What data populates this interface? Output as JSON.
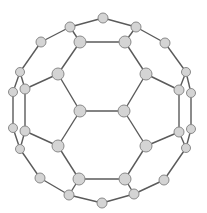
{
  "diagram": {
    "title": "",
    "colors": {
      "background": "#ffffff",
      "edge": "#5a5a5a",
      "node_fill": "#d4d4d4",
      "node_stroke": "#8a8a8a"
    },
    "nodes": [
      {
        "id": 0,
        "x": 103,
        "y": 18,
        "r": 5
      },
      {
        "id": 1,
        "x": 70,
        "y": 27,
        "r": 5
      },
      {
        "id": 2,
        "x": 136,
        "y": 27,
        "r": 5
      },
      {
        "id": 3,
        "x": 80,
        "y": 42,
        "r": 6
      },
      {
        "id": 4,
        "x": 125,
        "y": 42,
        "r": 6
      },
      {
        "id": 5,
        "x": 41,
        "y": 42,
        "r": 5
      },
      {
        "id": 6,
        "x": 165,
        "y": 43,
        "r": 5
      },
      {
        "id": 7,
        "x": 20,
        "y": 72,
        "r": 4.5
      },
      {
        "id": 8,
        "x": 186,
        "y": 72,
        "r": 4.5
      },
      {
        "id": 9,
        "x": 58,
        "y": 74,
        "r": 6
      },
      {
        "id": 10,
        "x": 146,
        "y": 74,
        "r": 6
      },
      {
        "id": 11,
        "x": 13,
        "y": 92,
        "r": 4.5
      },
      {
        "id": 12,
        "x": 25,
        "y": 89,
        "r": 5
      },
      {
        "id": 13,
        "x": 179,
        "y": 90,
        "r": 5
      },
      {
        "id": 14,
        "x": 191,
        "y": 93,
        "r": 4.5
      },
      {
        "id": 15,
        "x": 80,
        "y": 111,
        "r": 6
      },
      {
        "id": 16,
        "x": 124,
        "y": 111,
        "r": 6
      },
      {
        "id": 17,
        "x": 13,
        "y": 128,
        "r": 4.5
      },
      {
        "id": 18,
        "x": 25,
        "y": 131,
        "r": 5
      },
      {
        "id": 19,
        "x": 179,
        "y": 132,
        "r": 5
      },
      {
        "id": 20,
        "x": 191,
        "y": 129,
        "r": 4.5
      },
      {
        "id": 21,
        "x": 20,
        "y": 149,
        "r": 4.5
      },
      {
        "id": 22,
        "x": 186,
        "y": 148,
        "r": 4.5
      },
      {
        "id": 23,
        "x": 58,
        "y": 146,
        "r": 6
      },
      {
        "id": 24,
        "x": 146,
        "y": 146,
        "r": 6
      },
      {
        "id": 25,
        "x": 40,
        "y": 178,
        "r": 5
      },
      {
        "id": 26,
        "x": 164,
        "y": 180,
        "r": 5
      },
      {
        "id": 27,
        "x": 79,
        "y": 179,
        "r": 6
      },
      {
        "id": 28,
        "x": 125,
        "y": 179,
        "r": 6
      },
      {
        "id": 29,
        "x": 69,
        "y": 195,
        "r": 5
      },
      {
        "id": 30,
        "x": 134,
        "y": 194,
        "r": 5
      },
      {
        "id": 31,
        "x": 102,
        "y": 203,
        "r": 5
      }
    ],
    "edges": [
      [
        0,
        1
      ],
      [
        0,
        2
      ],
      [
        1,
        3
      ],
      [
        2,
        4
      ],
      [
        3,
        4
      ],
      [
        1,
        5
      ],
      [
        2,
        6
      ],
      [
        5,
        7
      ],
      [
        6,
        8
      ],
      [
        3,
        9
      ],
      [
        4,
        10
      ],
      [
        7,
        11
      ],
      [
        7,
        12
      ],
      [
        8,
        13
      ],
      [
        8,
        14
      ],
      [
        9,
        12
      ],
      [
        10,
        13
      ],
      [
        9,
        15
      ],
      [
        10,
        16
      ],
      [
        15,
        16
      ],
      [
        11,
        17
      ],
      [
        12,
        18
      ],
      [
        13,
        19
      ],
      [
        14,
        20
      ],
      [
        17,
        21
      ],
      [
        18,
        21
      ],
      [
        19,
        22
      ],
      [
        20,
        22
      ],
      [
        15,
        23
      ],
      [
        16,
        24
      ],
      [
        18,
        23
      ],
      [
        19,
        24
      ],
      [
        21,
        25
      ],
      [
        22,
        26
      ],
      [
        23,
        27
      ],
      [
        24,
        28
      ],
      [
        27,
        28
      ],
      [
        25,
        29
      ],
      [
        26,
        30
      ],
      [
        27,
        29
      ],
      [
        28,
        30
      ],
      [
        29,
        31
      ],
      [
        30,
        31
      ]
    ]
  }
}
